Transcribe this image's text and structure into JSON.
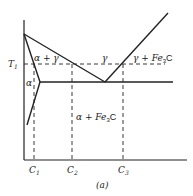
{
  "figure": {
    "caption": "(a)",
    "colors": {
      "line": "#222222",
      "background": "#ffffff"
    },
    "axes": {
      "y_label": "T",
      "y_label_sub": "1",
      "x_ticks": [
        {
          "label": "C",
          "sub": "1"
        },
        {
          "label": "C",
          "sub": "2"
        },
        {
          "label": "C",
          "sub": "3"
        }
      ]
    },
    "regions": {
      "alpha": "α",
      "alpha_gamma": "α + γ",
      "gamma": "γ",
      "gamma_fe3c": "γ + Fe",
      "gamma_fe3c_sub": "3",
      "gamma_fe3c_tail": "C",
      "alpha_fe3c": "α + Fe",
      "alpha_fe3c_sub": "3",
      "alpha_fe3c_tail": "C"
    }
  }
}
